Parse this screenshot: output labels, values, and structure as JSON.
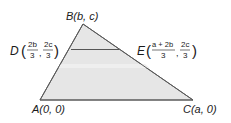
{
  "diagram": {
    "type": "triangle-coordinate-geometry",
    "colors": {
      "fill": "#e6e6e6",
      "stroke": "#5a5a5a",
      "segment": "#555555",
      "text": "#1a1a1a",
      "band": "#f0f0f0"
    },
    "vertices": {
      "A": {
        "name": "A",
        "coords": "(0, 0)",
        "x": 40,
        "y": 100
      },
      "B": {
        "name": "B",
        "coords": "(b, c)",
        "x": 83,
        "y": 24
      },
      "C": {
        "name": "C",
        "coords": "(a, 0)",
        "x": 193,
        "y": 100
      }
    },
    "points": {
      "D": {
        "name": "D",
        "x_num": "2b",
        "x_den": "3",
        "y_num": "2c",
        "y_den": "3",
        "x": 71,
        "y": 49
      },
      "E": {
        "name": "E",
        "x_num": "a + 2b",
        "x_den": "3",
        "y_num": "2c",
        "y_den": "3",
        "x": 124,
        "y": 49
      }
    },
    "segments": [
      {
        "from": "A",
        "to": "B"
      },
      {
        "from": "B",
        "to": "C"
      },
      {
        "from": "A",
        "to": "C"
      },
      {
        "from": "D",
        "to": "E"
      }
    ],
    "labels": {
      "A": "A(0, 0)",
      "B": "B(b, c)",
      "C": "C(a, 0)",
      "D_letter": "D",
      "E_letter": "E",
      "comma": ","
    }
  }
}
